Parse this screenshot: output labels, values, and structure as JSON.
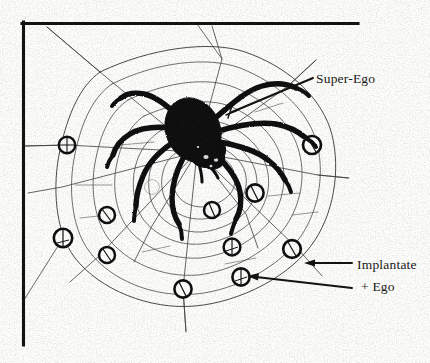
{
  "figure": {
    "type": "diagram",
    "background_color": "#fdfdfc",
    "ink_color": "#111110",
    "web_line_color": "#3b3b3a"
  },
  "border": {
    "name": "frame-corner-rule",
    "shape": "L",
    "color": "#111110",
    "thickness_px": 3,
    "left_x": 22,
    "top_y": 22,
    "left_from_y": 22,
    "left_to_y": 345,
    "top_from_x": 22,
    "top_to_x": 358
  },
  "labels": {
    "super_ego": "Super-Ego",
    "implantate": "Implantate",
    "plus_ego": "+ Ego"
  },
  "leaders": {
    "super_ego_line": {
      "x1": 313,
      "y1": 78,
      "x2": 232,
      "y2": 112
    },
    "implantate_arrow": {
      "x1": 352,
      "y1": 263,
      "x2": 310,
      "y2": 263
    },
    "plus_ego_arrow": {
      "x1": 352,
      "y1": 287,
      "x2": 248,
      "y2": 277
    }
  },
  "spider": {
    "name": "spider",
    "color": "#0d0d0c",
    "body": {
      "cx": 194,
      "cy": 131,
      "rx": 26,
      "ry": 32,
      "rotation_deg": -24
    },
    "head": {
      "cx": 212,
      "cy": 157,
      "rx": 13,
      "ry": 11,
      "rotation_deg": -20
    },
    "leg_count": 8
  },
  "web": {
    "center": {
      "x": 197,
      "y": 152
    },
    "radial_count": 9,
    "ring_count": 7,
    "node_marker_count": 12
  },
  "node_markers": [
    {
      "id": 1,
      "cx": 67,
      "cy": 145,
      "r": 8.2
    },
    {
      "id": 2,
      "cx": 107,
      "cy": 215,
      "r": 8.0
    },
    {
      "id": 3,
      "cx": 63,
      "cy": 238,
      "r": 9.2
    },
    {
      "id": 4,
      "cx": 107,
      "cy": 255,
      "r": 8.0
    },
    {
      "id": 5,
      "cx": 183,
      "cy": 289,
      "r": 8.6
    },
    {
      "id": 6,
      "cx": 212,
      "cy": 210,
      "r": 8.0
    },
    {
      "id": 7,
      "cx": 255,
      "cy": 193,
      "r": 8.6
    },
    {
      "id": 8,
      "cx": 232,
      "cy": 247,
      "r": 8.4
    },
    {
      "id": 9,
      "cx": 241,
      "cy": 277,
      "r": 8.6
    },
    {
      "id": 10,
      "cx": 292,
      "cy": 249,
      "r": 8.8
    },
    {
      "id": 11,
      "cx": 312,
      "cy": 145,
      "r": 9.0
    },
    {
      "id": 12,
      "cx": 152,
      "cy": 187,
      "r": 0.0
    }
  ]
}
